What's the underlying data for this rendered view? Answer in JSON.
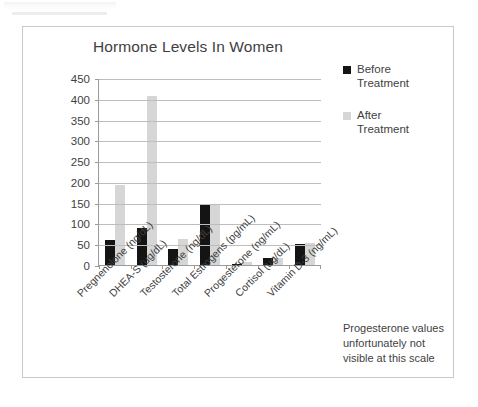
{
  "chart_data": {
    "type": "bar",
    "title": "Hormone Levels In Women",
    "xlabel": "",
    "ylabel": "",
    "ylim": [
      0,
      450
    ],
    "ytick_step": 50,
    "yticks": [
      450,
      400,
      350,
      300,
      250,
      200,
      150,
      100,
      50,
      0
    ],
    "grid": true,
    "legend_position": "right-top",
    "categories": [
      "Pregnenolone (ng/dL)",
      "DHEA-S (ug/dL)",
      "Testosterone (ng/dL)",
      "Total Estrogens (pg/mL)",
      "Progesterone (ng/mL)",
      "Cortisol (ug/dL)",
      "Vitamin D-3 (ng/mL)"
    ],
    "series": [
      {
        "name": "Before Treatment",
        "color": "#141414",
        "values": [
          61,
          89,
          39,
          144,
          2,
          17,
          50
        ]
      },
      {
        "name": "After Treatment",
        "color": "#d6d6d6",
        "values": [
          193,
          407,
          63,
          145,
          8,
          16,
          52
        ]
      }
    ],
    "annotations": [
      "Progesterone values unfortunately not visible at this scale"
    ]
  },
  "chart": {
    "title": "Hormone Levels In Women",
    "footnote_line1": "Progesterone values",
    "footnote_line2": "unfortunately not",
    "footnote_line3": "visible at this scale"
  },
  "legend": {
    "items": [
      {
        "label_line1": "Before",
        "label_line2": "Treatment",
        "color": "#141414",
        "swatch": "square-marker-icon"
      },
      {
        "label_line1": "After",
        "label_line2": "Treatment",
        "color": "#d6d6d6",
        "swatch": "square-marker-icon"
      }
    ]
  }
}
